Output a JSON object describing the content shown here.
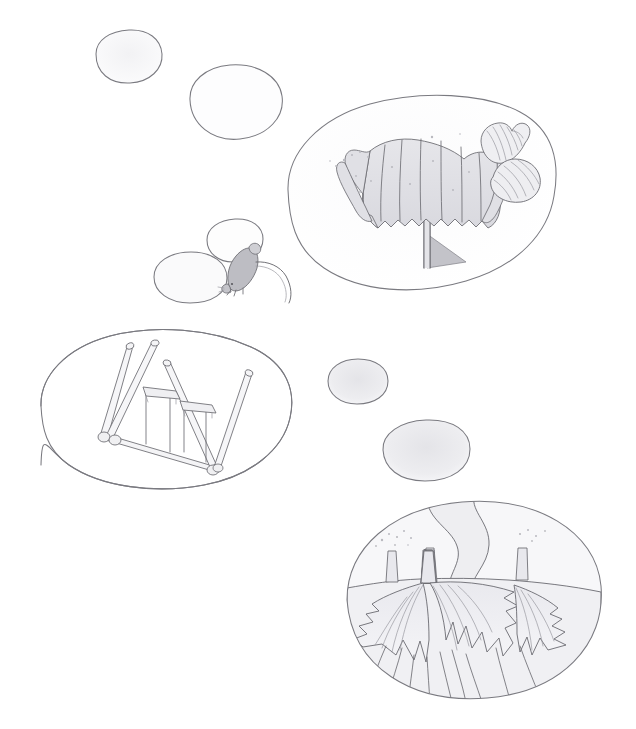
{
  "artwork": {
    "title": "Pencil sketch study sheet",
    "medium": "graphite pencil on white paper",
    "background_color": "#ffffff",
    "line_color": "#6e6e74",
    "shade_color": "#ededf0",
    "canvas": {
      "width": 636,
      "height": 729
    }
  },
  "vignettes": [
    {
      "id": "blob-top-left-small",
      "label": "empty rounded blob, upper left",
      "state": "empty",
      "fill": "#f4f4f5",
      "center": {
        "x": 128,
        "y": 62
      },
      "size": {
        "w": 74,
        "h": 52
      }
    },
    {
      "id": "blob-top-left-large",
      "label": "empty rounded blob, upper left second",
      "state": "empty",
      "fill": "#fbfbfc",
      "center": {
        "x": 235,
        "y": 100
      },
      "size": {
        "w": 96,
        "h": 78
      }
    },
    {
      "id": "blob-barnacle-scene",
      "label": "barnacle cluster with two striped shells",
      "state": "drawn",
      "fill": "#fafafb",
      "center": {
        "x": 421,
        "y": 192
      },
      "size": {
        "w": 270,
        "h": 192
      },
      "contents": [
        "barnacle-cluster",
        "stalk",
        "cast-shadow",
        "shell-upper",
        "shell-lower",
        "sand-specks"
      ]
    },
    {
      "id": "blob-speech-upper",
      "label": "empty rounded blob above the mouse",
      "state": "empty",
      "fill": "#fdfdfd",
      "center": {
        "x": 235,
        "y": 240
      },
      "size": {
        "w": 56,
        "h": 42
      }
    },
    {
      "id": "blob-speech-lower",
      "label": "empty rounded blob beside the mouse",
      "state": "empty",
      "fill": "#fafafa",
      "center": {
        "x": 190,
        "y": 277
      },
      "size": {
        "w": 72,
        "h": 50
      }
    },
    {
      "id": "blob-swingset-scene",
      "label": "swing set frame with two swings",
      "state": "drawn",
      "fill": "#ffffff",
      "center": {
        "x": 176,
        "y": 408
      },
      "size": {
        "w": 270,
        "h": 160
      },
      "contents": [
        "swing-frame-left-legs",
        "swing-frame-right-legs",
        "cross-beam",
        "swing-seat-left",
        "swing-seat-right",
        "swing-ropes"
      ]
    },
    {
      "id": "blob-mid-right-small",
      "label": "empty shaded blob, middle right",
      "state": "empty",
      "fill": "#eeeef0",
      "center": {
        "x": 357,
        "y": 381
      },
      "size": {
        "w": 60,
        "h": 46
      }
    },
    {
      "id": "blob-mid-right-large",
      "label": "empty shaded blob, lower middle right",
      "state": "empty",
      "fill": "#e9e9ec",
      "center": {
        "x": 426,
        "y": 450
      },
      "size": {
        "w": 86,
        "h": 60
      }
    },
    {
      "id": "blob-anemone-scene",
      "label": "underwater anemones on a seabed with a drifting ribbon",
      "state": "drawn",
      "fill": "#f6f6f8",
      "center": {
        "x": 474,
        "y": 601
      },
      "size": {
        "w": 256,
        "h": 200
      },
      "contents": [
        "seabed-ridge",
        "anemone-left",
        "anemone-center",
        "anemone-right",
        "stalk-trio",
        "wavy-ribbon",
        "bubble-specks"
      ]
    }
  ],
  "figures": [
    {
      "id": "mouse",
      "label": "small mouse with a curling tail",
      "position": {
        "x": 246,
        "y": 270
      },
      "fill": "#bfbfc4"
    }
  ],
  "objects": [
    {
      "id": "barnacle-cluster",
      "label": "ribbed barnacle cluster"
    },
    {
      "id": "shell-upper",
      "label": "small striped spiral shell"
    },
    {
      "id": "shell-lower",
      "label": "larger striped clam shell"
    },
    {
      "id": "swing-seat-left",
      "label": "left swing seat"
    },
    {
      "id": "swing-seat-right",
      "label": "right swing seat"
    },
    {
      "id": "wavy-ribbon",
      "label": "wavy current ribbon"
    }
  ]
}
